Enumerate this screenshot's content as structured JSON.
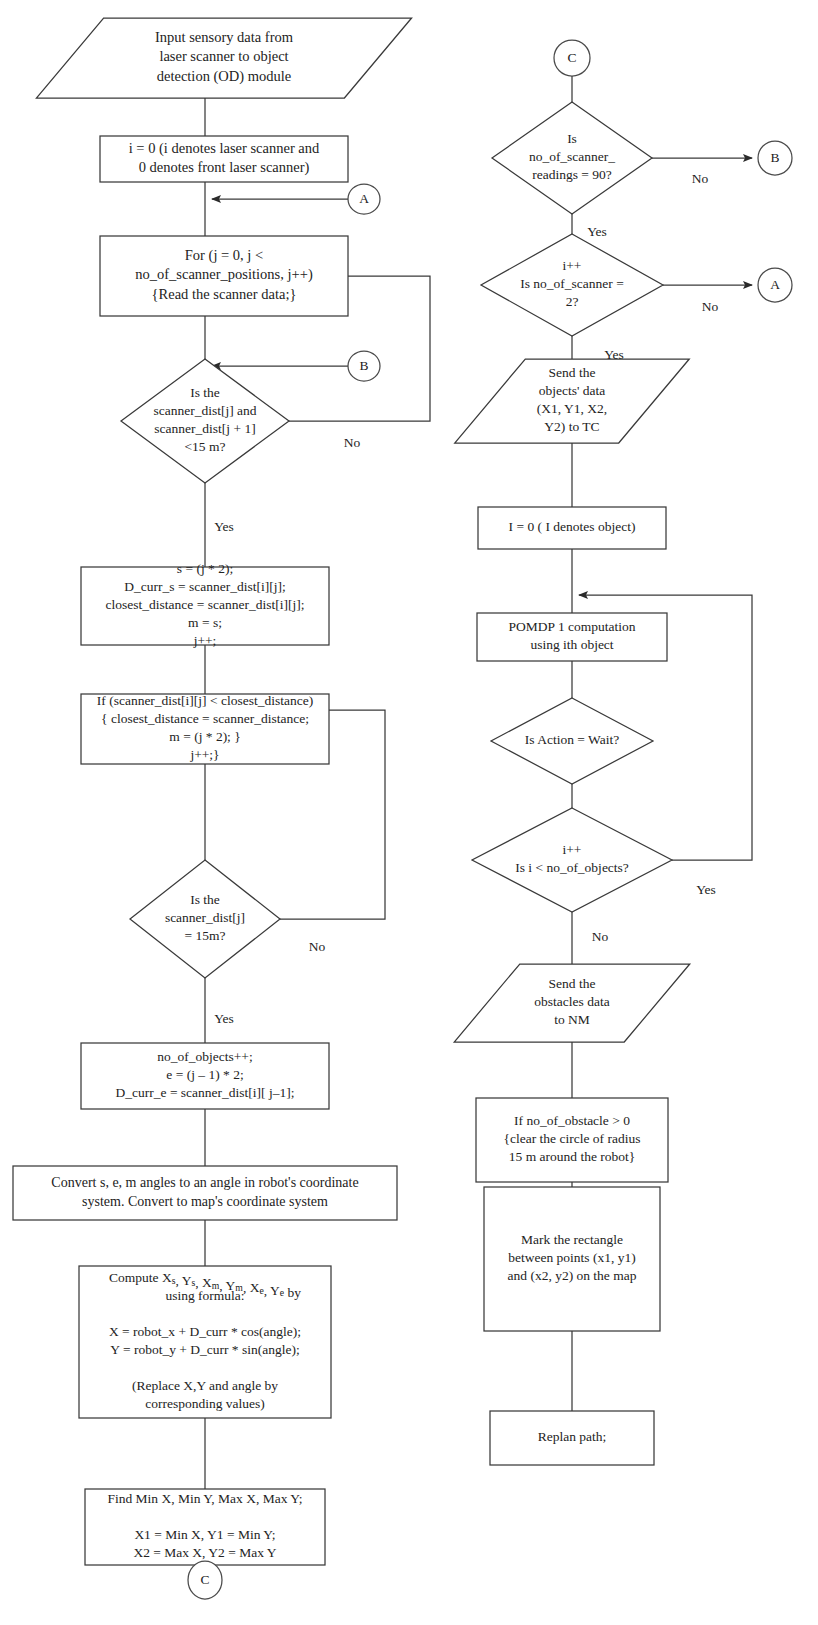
{
  "diagram": {
    "background": "#ffffff",
    "stroke_color": "#3a3a3a",
    "text_color": "#232323",
    "width": 818,
    "height": 1625
  },
  "nodes": [
    {
      "id": "input-sensory",
      "name": "input-sensory-data-parallelogram",
      "shape": "parallelogram",
      "x": 224,
      "y": 58,
      "w": 308,
      "h": 80,
      "font": 14.5,
      "lines": [
        "Input sensory data from",
        "laser scanner to object",
        "detection (OD) module"
      ]
    },
    {
      "id": "init-i",
      "name": "init-scanner-index-box",
      "shape": "rect",
      "x": 224,
      "y": 159,
      "w": 248,
      "h": 46,
      "font": 14.5,
      "lines": [
        "i = 0 (i denotes laser scanner and",
        "0 denotes front laser scanner)"
      ]
    },
    {
      "id": "for-loop",
      "name": "for-scanner-positions-box",
      "shape": "rect",
      "x": 224,
      "y": 276,
      "w": 248,
      "h": 80,
      "font": 14.5,
      "lines": [
        "For (j = 0, j <",
        "no_of_scanner_positions, j++)",
        "{Read the scanner data;}"
      ]
    },
    {
      "id": "dec-dist15",
      "name": "decision-scanner-dist-less-15m",
      "shape": "diamond",
      "x": 205,
      "y": 421,
      "w": 168,
      "h": 124,
      "font": 13.5,
      "lines": [
        "Is the",
        "scanner_dist[j] and",
        "scanner_dist[j + 1]",
        "<15 m?"
      ]
    },
    {
      "id": "assign-s",
      "name": "assign-start-index-box",
      "shape": "rect",
      "x": 205,
      "y": 606,
      "w": 248,
      "h": 78,
      "font": 13.5,
      "lines": [
        "s = (j * 2);",
        "D_curr_s = scanner_dist[i][j];",
        "closest_distance = scanner_dist[i][j];",
        "m = s;",
        "j++;"
      ]
    },
    {
      "id": "if-closest",
      "name": "update-closest-distance-box",
      "shape": "rect",
      "x": 205,
      "y": 729,
      "w": 248,
      "h": 70,
      "font": 13.5,
      "lines": [
        "If (scanner_dist[i][j] < closest_distance)",
        "{ closest_distance = scanner_distance;",
        "m = (j * 2); }",
        "j++;}"
      ]
    },
    {
      "id": "dec-dist-eq15",
      "name": "decision-scanner-dist-equals-15m",
      "shape": "diamond",
      "x": 205,
      "y": 919,
      "w": 150,
      "h": 118,
      "font": 13.5,
      "lines": [
        "Is the",
        "scanner_dist[j]",
        "= 15m?"
      ]
    },
    {
      "id": "count-objects",
      "name": "increment-objects-box",
      "shape": "rect",
      "x": 205,
      "y": 1076,
      "w": 248,
      "h": 66,
      "font": 13.5,
      "lines": [
        "no_of_objects++;",
        "e = (j – 1) * 2;",
        "D_curr_e = scanner_dist[i][ j–1];"
      ]
    },
    {
      "id": "convert-angles",
      "name": "convert-angles-box",
      "shape": "rect",
      "x": 205,
      "y": 1193,
      "w": 384,
      "h": 54,
      "font": 14,
      "lines": [
        "Convert s, e, m angles to an angle in robot's coordinate",
        "system. Convert to map's coordinate system"
      ]
    },
    {
      "id": "compute-xy",
      "name": "compute-coordinates-box",
      "shape": "rect",
      "x": 205,
      "y": 1342,
      "w": 252,
      "h": 152,
      "font": 13.5,
      "lines": [
        "Compute X<s>s</s>, Y<s>s</s>, X<s>m</s>, Y<s>m</s>, X<s>e</s>, Y<s>e</s> by",
        "using formula:",
        "",
        "X = robot_x + D_curr * cos(angle);",
        "Y = robot_y + D_curr * sin(angle);",
        "",
        "(Replace X,Y and angle by",
        "corresponding values)"
      ]
    },
    {
      "id": "find-minmax",
      "name": "find-min-max-box",
      "shape": "rect",
      "x": 205,
      "y": 1527,
      "w": 240,
      "h": 76,
      "font": 13.5,
      "lines": [
        "Find Min X, Min Y, Max X, Max Y;",
        "",
        "X1 = Min X, Y1 = Min Y;",
        "X2 = Max X, Y2 = Max Y"
      ]
    },
    {
      "id": "dec-readings90",
      "name": "decision-scanner-readings-90",
      "shape": "diamond",
      "x": 572,
      "y": 158,
      "w": 160,
      "h": 112,
      "font": 13.5,
      "lines": [
        "Is",
        "no_of_scanner_",
        "readings = 90?"
      ]
    },
    {
      "id": "dec-scanner2",
      "name": "decision-no-of-scanner-2",
      "shape": "diamond",
      "x": 572,
      "y": 285,
      "w": 182,
      "h": 102,
      "font": 13.5,
      "lines": [
        "i++",
        "Is no_of_scanner =",
        "2?"
      ]
    },
    {
      "id": "send-objects",
      "name": "send-objects-data-parallelogram",
      "shape": "parallelogram",
      "x": 572,
      "y": 401,
      "w": 164,
      "h": 84,
      "font": 13.5,
      "lines": [
        "Send the",
        "objects' data",
        "(X1, Y1, X2,",
        "Y2) to TC"
      ]
    },
    {
      "id": "init-object",
      "name": "init-object-index-box",
      "shape": "rect",
      "x": 572,
      "y": 528,
      "w": 188,
      "h": 42,
      "font": 13.5,
      "lines": [
        "I = 0 ( I denotes object)"
      ]
    },
    {
      "id": "pomdp",
      "name": "pomdp-computation-box",
      "shape": "rect",
      "x": 572,
      "y": 637,
      "w": 190,
      "h": 48,
      "font": 13.5,
      "lines": [
        "POMDP 1 computation",
        "using ith object"
      ]
    },
    {
      "id": "dec-wait",
      "name": "decision-is-action-wait",
      "shape": "diamond",
      "x": 572,
      "y": 741,
      "w": 162,
      "h": 86,
      "font": 13.5,
      "lines": [
        "Is Action = Wait?"
      ]
    },
    {
      "id": "dec-more-objects",
      "name": "decision-more-objects",
      "shape": "diamond",
      "x": 572,
      "y": 860,
      "w": 200,
      "h": 104,
      "font": 13.5,
      "lines": [
        "i++",
        "Is i < no_of_objects?"
      ]
    },
    {
      "id": "send-obstacles",
      "name": "send-obstacles-data-parallelogram",
      "shape": "parallelogram",
      "x": 572,
      "y": 1003,
      "w": 170,
      "h": 78,
      "font": 13.5,
      "lines": [
        "Send the",
        "obstacles data",
        "to NM"
      ]
    },
    {
      "id": "clear-circle",
      "name": "clear-circle-radius-box",
      "shape": "rect",
      "x": 572,
      "y": 1140,
      "w": 192,
      "h": 84,
      "font": 13.5,
      "lines": [
        "If no_of_obstacle > 0",
        "{clear the circle of radius",
        "15 m around the robot}"
      ]
    },
    {
      "id": "mark-rect",
      "name": "mark-rectangle-box",
      "shape": "rect",
      "x": 572,
      "y": 1259,
      "w": 176,
      "h": 144,
      "font": 13.5,
      "lines": [
        "Mark the rectangle",
        "between points (x1, y1)",
        "and (x2, y2) on the map"
      ]
    },
    {
      "id": "replan",
      "name": "replan-path-box",
      "shape": "rect",
      "x": 572,
      "y": 1438,
      "w": 164,
      "h": 54,
      "font": 13.5,
      "lines": [
        "Replan path;"
      ]
    }
  ],
  "connectors": [
    {
      "id": "conn-A-right",
      "name": "connector-circle-a-right",
      "label": "A",
      "cx": 364,
      "cy": 199,
      "rx": 16,
      "ry": 15
    },
    {
      "id": "conn-B-right",
      "name": "connector-circle-b-right",
      "label": "B",
      "cx": 364,
      "cy": 366,
      "rx": 16,
      "ry": 15
    },
    {
      "id": "conn-C-bottom",
      "name": "connector-circle-c-bottom",
      "label": "C",
      "cx": 205,
      "cy": 1580,
      "rx": 17,
      "ry": 19
    },
    {
      "id": "conn-C-top",
      "name": "connector-circle-c-top",
      "label": "C",
      "cx": 572,
      "cy": 58,
      "rx": 18,
      "ry": 18
    },
    {
      "id": "conn-B-target",
      "name": "connector-circle-b-target",
      "label": "B",
      "cx": 775,
      "cy": 158,
      "rx": 17,
      "ry": 17
    },
    {
      "id": "conn-A-target",
      "name": "connector-circle-a-target",
      "label": "A",
      "cx": 775,
      "cy": 285,
      "rx": 17,
      "ry": 17
    }
  ],
  "edges": [
    {
      "id": "e1",
      "name": "edge-input-to-init",
      "d": "M 205 98 L 205 153",
      "arrow": true
    },
    {
      "id": "e2",
      "name": "edge-init-to-forloop",
      "d": "M 205 182 L 205 270",
      "arrow": true
    },
    {
      "id": "e3",
      "name": "edge-a-into-trunk",
      "d": "M 348 199 L 212 199",
      "arrow": true
    },
    {
      "id": "e4",
      "name": "edge-forloop-to-decision",
      "d": "M 205 316 L 205 415",
      "arrow": true
    },
    {
      "id": "e5",
      "name": "edge-b-into-trunk",
      "d": "M 348 366 L 212 366",
      "arrow": true
    },
    {
      "id": "e6",
      "name": "edge-dist15-no-loopback",
      "d": "M 289 421 L 430 421 L 430 276 L 336 276",
      "arrow": true
    },
    {
      "id": "e7",
      "name": "edge-dist15-yes-to-assign",
      "d": "M 205 483 L 205 600",
      "arrow": true
    },
    {
      "id": "e8",
      "name": "edge-assign-to-if",
      "d": "M 205 645 L 205 723",
      "arrow": true
    },
    {
      "id": "e9",
      "name": "edge-if-to-decision15eq",
      "d": "M 205 764 L 205 913",
      "arrow": true
    },
    {
      "id": "e10",
      "name": "edge-eq15-no-loopback",
      "d": "M 280 919 L 385 919 L 385 710 L 212 710",
      "arrow": true
    },
    {
      "id": "e11",
      "name": "edge-eq15-yes-to-count",
      "d": "M 205 978 L 205 1070",
      "arrow": true
    },
    {
      "id": "e12",
      "name": "edge-count-to-convert",
      "d": "M 205 1109 L 205 1187",
      "arrow": true
    },
    {
      "id": "e13",
      "name": "edge-convert-to-compute",
      "d": "M 205 1220 L 205 1336",
      "arrow": true
    },
    {
      "id": "e14",
      "name": "edge-compute-to-findminmax",
      "d": "M 205 1418 L 205 1521",
      "arrow": true
    },
    {
      "id": "e15",
      "name": "edge-findminmax-to-c",
      "d": "M 205 1565 L 205 1597",
      "arrow": true
    },
    {
      "id": "e16",
      "name": "edge-ctop-to-readings90",
      "d": "M 572 76 L 572 152",
      "arrow": true
    },
    {
      "id": "e17",
      "name": "edge-readings90-no-to-b",
      "d": "M 652 158 L 752 158",
      "arrow": true
    },
    {
      "id": "e18",
      "name": "edge-readings90-yes-to-scan2",
      "d": "M 572 214 L 572 279",
      "arrow": true
    },
    {
      "id": "e19",
      "name": "edge-scanner2-no-to-a",
      "d": "M 663 285 L 752 285",
      "arrow": true
    },
    {
      "id": "e20",
      "name": "edge-scanner2-yes-to-send",
      "d": "M 572 336 L 572 395",
      "arrow": true
    },
    {
      "id": "e21",
      "name": "edge-send-to-initobject",
      "d": "M 572 443 L 572 522",
      "arrow": true
    },
    {
      "id": "e22",
      "name": "edge-initobject-to-pomdp",
      "d": "M 572 549 L 572 631",
      "arrow": true
    },
    {
      "id": "e23",
      "name": "edge-pomdp-to-wait",
      "d": "M 572 661 L 572 735",
      "arrow": true
    },
    {
      "id": "e24",
      "name": "edge-wait-to-moreobjects",
      "d": "M 572 784 L 572 854",
      "arrow": true
    },
    {
      "id": "e25",
      "name": "edge-moreobjects-yes-loopback",
      "d": "M 672 860 L 752 860 L 752 595 L 579 595",
      "arrow": true
    },
    {
      "id": "e26",
      "name": "edge-moreobjects-no-to-send",
      "d": "M 572 912 L 572 997",
      "arrow": true
    },
    {
      "id": "e27",
      "name": "edge-sendobstacles-to-clear",
      "d": "M 572 1042 L 572 1134",
      "arrow": true
    },
    {
      "id": "e28",
      "name": "edge-clear-to-markrect",
      "d": "M 572 1182 L 572 1253",
      "arrow": true
    },
    {
      "id": "e29",
      "name": "edge-markrect-to-replan",
      "d": "M 572 1331 L 572 1432",
      "arrow": true
    }
  ],
  "edge_labels": [
    {
      "id": "l1",
      "name": "edge-label-no-dist15",
      "text": "No",
      "x": 352,
      "y": 444
    },
    {
      "id": "l2",
      "name": "edge-label-yes-dist15",
      "text": "Yes",
      "x": 224,
      "y": 528
    },
    {
      "id": "l3",
      "name": "edge-label-no-eq15",
      "text": "No",
      "x": 317,
      "y": 948
    },
    {
      "id": "l4",
      "name": "edge-label-yes-eq15",
      "text": "Yes",
      "x": 224,
      "y": 1020
    },
    {
      "id": "l5",
      "name": "edge-label-no-readings90",
      "text": "No",
      "x": 700,
      "y": 180
    },
    {
      "id": "l6",
      "name": "edge-label-yes-readings90",
      "text": "Yes",
      "x": 597,
      "y": 233
    },
    {
      "id": "l7",
      "name": "edge-label-no-scanner2",
      "text": "No",
      "x": 710,
      "y": 308
    },
    {
      "id": "l8",
      "name": "edge-label-yes-scanner2",
      "text": "Yes",
      "x": 614,
      "y": 356
    },
    {
      "id": "l9",
      "name": "edge-label-yes-moreobjects",
      "text": "Yes",
      "x": 706,
      "y": 891
    },
    {
      "id": "l10",
      "name": "edge-label-no-moreobjects",
      "text": "No",
      "x": 600,
      "y": 938
    }
  ]
}
